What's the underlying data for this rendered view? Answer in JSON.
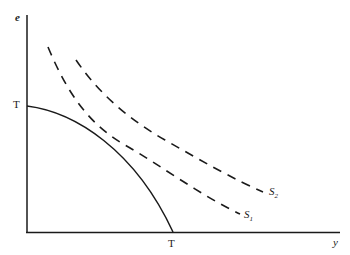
{
  "diagram": {
    "axes": {
      "vertical_label": "e",
      "horizontal_label": "y"
    },
    "curves": [
      {
        "name": "transformation-curve",
        "style": "solid",
        "start_label": "T",
        "end_label": "T"
      },
      {
        "name": "S1",
        "style": "dashed",
        "label_main": "S",
        "label_sub": "1"
      },
      {
        "name": "S2",
        "style": "dashed",
        "label_main": "S",
        "label_sub": "2"
      }
    ],
    "colors": {
      "line": "#1a1a1a",
      "background": "#ffffff"
    }
  }
}
